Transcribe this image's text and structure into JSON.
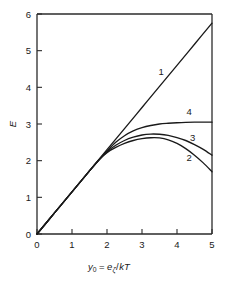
{
  "chart_data": {
    "type": "line",
    "title": "",
    "subtitle": "",
    "xlabel": "y₀ = eζ / kT",
    "xlabel_parts": {
      "var": "y",
      "var_sub": "0",
      "equals": "=",
      "numerator": "e",
      "numerator_sub": "ζ",
      "slash": "/",
      "denominator": "kT"
    },
    "ylabel": "E",
    "xlim": [
      0,
      5
    ],
    "ylim": [
      0,
      6
    ],
    "xticks": [
      0,
      1,
      2,
      3,
      4,
      5
    ],
    "yticks": [
      0,
      1,
      2,
      3,
      4,
      5,
      6
    ],
    "xticklabels": [
      "0",
      "1",
      "2",
      "3",
      "4",
      "5"
    ],
    "yticklabels": [
      "0",
      "1",
      "2",
      "3",
      "4",
      "5",
      "6"
    ],
    "grid": false,
    "legend_position": "inline-curve-labels",
    "frame": "box",
    "series": [
      {
        "name": "1",
        "label": "1",
        "label_x": 3.55,
        "label_y": 4.35,
        "color": "#1a1a1a",
        "x": [
          0.0,
          0.5,
          1.0,
          1.5,
          2.0,
          2.5,
          3.0,
          3.5,
          4.0,
          4.5,
          5.0
        ],
        "y": [
          0.0,
          0.575,
          1.15,
          1.725,
          2.3,
          2.875,
          3.45,
          4.025,
          4.6,
          5.175,
          5.75
        ]
      },
      {
        "name": "2",
        "label": "2",
        "label_x": 4.35,
        "label_y": 1.98,
        "color": "#1a1a1a",
        "x": [
          0.0,
          0.5,
          1.0,
          1.5,
          1.8,
          2.0,
          2.25,
          2.5,
          2.75,
          3.0,
          3.25,
          3.5,
          3.75,
          4.0,
          4.25,
          4.5,
          4.75,
          5.0
        ],
        "y": [
          0.0,
          0.575,
          1.15,
          1.72,
          2.05,
          2.22,
          2.36,
          2.47,
          2.55,
          2.6,
          2.625,
          2.62,
          2.57,
          2.47,
          2.33,
          2.15,
          1.94,
          1.7
        ]
      },
      {
        "name": "3",
        "label": "3",
        "label_x": 4.45,
        "label_y": 2.53,
        "color": "#1a1a1a",
        "x": [
          0.0,
          0.5,
          1.0,
          1.5,
          1.8,
          2.0,
          2.25,
          2.5,
          2.75,
          3.0,
          3.25,
          3.5,
          3.75,
          4.0,
          4.25,
          4.5,
          4.75,
          5.0
        ],
        "y": [
          0.0,
          0.575,
          1.15,
          1.72,
          2.05,
          2.24,
          2.42,
          2.55,
          2.64,
          2.7,
          2.725,
          2.72,
          2.69,
          2.63,
          2.55,
          2.44,
          2.31,
          2.15
        ]
      },
      {
        "name": "4",
        "label": "4",
        "label_x": 4.35,
        "label_y": 3.25,
        "color": "#1a1a1a",
        "x": [
          0.0,
          0.5,
          1.0,
          1.5,
          1.8,
          2.0,
          2.25,
          2.5,
          2.75,
          3.0,
          3.25,
          3.5,
          3.75,
          4.0,
          4.25,
          4.5,
          4.75,
          5.0
        ],
        "y": [
          0.0,
          0.575,
          1.15,
          1.72,
          2.05,
          2.26,
          2.5,
          2.68,
          2.81,
          2.9,
          2.96,
          3.0,
          3.02,
          3.035,
          3.045,
          3.05,
          3.05,
          3.05
        ]
      }
    ]
  }
}
